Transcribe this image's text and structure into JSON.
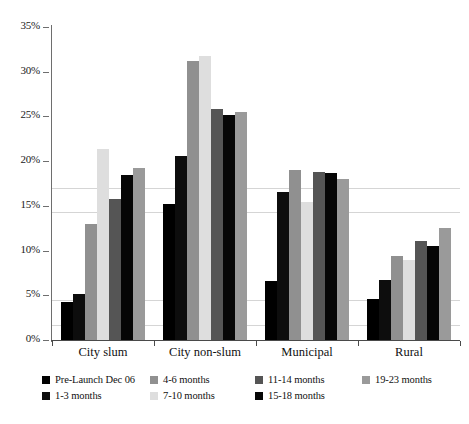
{
  "chart_data": {
    "type": "bar",
    "title": "",
    "subtitle": "",
    "xlabel": "",
    "ylabel": "",
    "categories": [
      "City slum",
      "City non-slum",
      "Municipal",
      "Rural"
    ],
    "ylim": [
      0,
      35
    ],
    "ytick_values": [
      0,
      5,
      10,
      15,
      20,
      25,
      30,
      35
    ],
    "ytick_labels": [
      "0%",
      "5%",
      "10%",
      "15%",
      "20%",
      "25%",
      "30%",
      "35%"
    ],
    "grid": false,
    "legend_position": "bottom",
    "value_suffix": "%",
    "series": [
      {
        "name": "Pre-Launch Dec 06",
        "color": "#000000",
        "values": [
          4.3,
          15.2,
          6.6,
          4.6
        ]
      },
      {
        "name": "1-3 months",
        "color": "#0d0d0d",
        "values": [
          5.1,
          20.6,
          16.6,
          6.7
        ]
      },
      {
        "name": "4-6 months",
        "color": "#909090",
        "values": [
          13.0,
          31.2,
          19.0,
          9.4
        ]
      },
      {
        "name": "7-10 months",
        "color": "#dedede",
        "values": [
          21.4,
          31.8,
          15.4,
          9.0
        ]
      },
      {
        "name": "11-14 months",
        "color": "#555555",
        "values": [
          15.8,
          25.8,
          18.8,
          11.1
        ]
      },
      {
        "name": "15-18 months",
        "color": "#060606",
        "values": [
          18.5,
          25.2,
          18.7,
          10.5
        ]
      },
      {
        "name": "19-23 months",
        "color": "#9a9a9a",
        "values": [
          19.2,
          25.5,
          18.0,
          12.5
        ]
      }
    ]
  },
  "legend": {
    "columns": [
      {
        "items": [
          "Pre-Launch Dec 06",
          "1-3 months"
        ]
      },
      {
        "items": [
          "4-6 months",
          "7-10 months"
        ]
      },
      {
        "items": [
          "11-14 months",
          "15-18 months"
        ]
      },
      {
        "items": [
          "19-23 months"
        ]
      }
    ]
  },
  "colors": {
    "axis": "#6e6e6e",
    "baseline": "#4a4a4a",
    "text": "#111111",
    "background": "#ffffff"
  }
}
